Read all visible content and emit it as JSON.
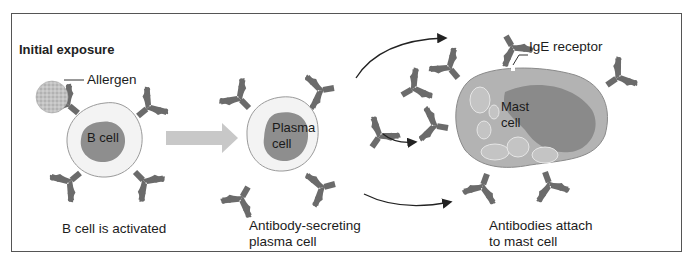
{
  "figure": {
    "heading": "Initial exposure",
    "stages": [
      {
        "id": "b-cell",
        "cell_label": "B cell",
        "caption_line1": "B cell is activated",
        "caption_line2": ""
      },
      {
        "id": "plasma-cell",
        "cell_label_line1": "Plasma",
        "cell_label_line2": "cell",
        "caption_line1": "Antibody-secreting",
        "caption_line2": "plasma cell"
      },
      {
        "id": "mast-cell",
        "cell_label_line1": "Mast",
        "cell_label_line2": "cell",
        "caption_line1": "Antibodies attach",
        "caption_line2": "to mast cell"
      }
    ],
    "callouts": {
      "allergen": "Allergen",
      "ige_receptor": "IgE receptor"
    },
    "colors": {
      "antibody": "#6b6b6b",
      "nucleus": "#8e8e8e",
      "cytoplasm_light": "#f2f2f2",
      "mast_cytoplasm": "#b3b3b3",
      "mast_nucleus": "#8a8a8a",
      "granule": "#c4c4c4",
      "allergen": "#bdbdbd",
      "block_arrow": "#c8c8c8",
      "curve_arrow": "#222222",
      "frame": "#555555"
    }
  }
}
